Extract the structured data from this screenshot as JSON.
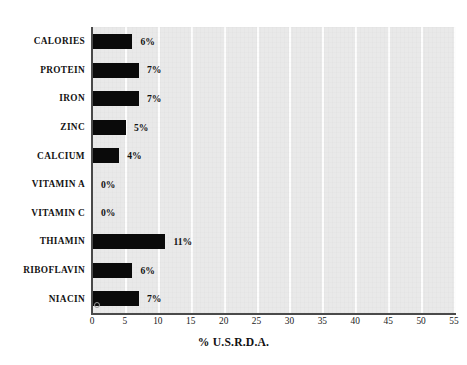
{
  "chart_data": {
    "type": "bar",
    "orientation": "horizontal",
    "title": "",
    "xlabel": "% U.S.R.D.A.",
    "ylabel": "",
    "xlim": [
      0,
      55
    ],
    "xticks": [
      "0",
      "5",
      "10",
      "15",
      "20",
      "25",
      "30",
      "35",
      "40",
      "45",
      "50",
      "55"
    ],
    "grid": true,
    "legend": false,
    "categories": [
      "CALORIES",
      "PROTEIN",
      "IRON",
      "ZINC",
      "CALCIUM",
      "VITAMIN A",
      "VITAMIN C",
      "THIAMIN",
      "RIBOFLAVIN",
      "NIACIN"
    ],
    "values": [
      6,
      7,
      7,
      5,
      4,
      0,
      0,
      11,
      6,
      7
    ],
    "value_labels": [
      "6%",
      "7%",
      "7%",
      "5%",
      "4%",
      "0%",
      "0%",
      "11%",
      "6%",
      "7%"
    ],
    "colors": {
      "bar": "#0a0a0a",
      "plot_background": "#e9e9e9",
      "gridline": "#fdfdfd",
      "axis": "#4a4a4a",
      "text": "#111111",
      "page_background": "#ffffff"
    }
  }
}
